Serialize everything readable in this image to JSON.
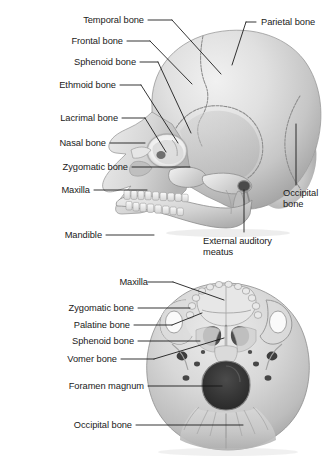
{
  "figure": {
    "background_color": "#ffffff",
    "text_color": "#1a1a1a",
    "leader_color": "#111111",
    "bone_light": "#e3e3e3",
    "bone_mid": "#c9c9c9",
    "bone_shadow": "#9a9a9a",
    "bone_dark": "#6e6e6e",
    "cavity_color": "#3a3a3a"
  },
  "panels": [
    {
      "id": "lateral-view",
      "name": "Lateral view of skull",
      "labels": [
        {
          "id": "temporal-bone",
          "text": "Temporal bone",
          "align": "right"
        },
        {
          "id": "frontal-bone",
          "text": "Frontal bone",
          "align": "right"
        },
        {
          "id": "sphenoid-bone",
          "text": "Sphenoid bone",
          "align": "right"
        },
        {
          "id": "ethmoid-bone",
          "text": "Ethmoid bone",
          "align": "right"
        },
        {
          "id": "lacrimal-bone",
          "text": "Lacrimal bone",
          "align": "right"
        },
        {
          "id": "nasal-bone",
          "text": "Nasal bone",
          "align": "right"
        },
        {
          "id": "zygomatic-bone",
          "text": "Zygomatic bone",
          "align": "right"
        },
        {
          "id": "maxilla",
          "text": "Maxilla",
          "align": "right"
        },
        {
          "id": "mandible",
          "text": "Mandible",
          "align": "right"
        },
        {
          "id": "parietal-bone",
          "text": "Parietal bone",
          "align": "left"
        },
        {
          "id": "occipital-bone-lateral",
          "text": "Occipital bone",
          "align": "left"
        },
        {
          "id": "external-auditory-meatus",
          "text": "External auditory meatus",
          "align": "left"
        }
      ]
    },
    {
      "id": "inferior-view",
      "name": "Inferior view of skull",
      "labels": [
        {
          "id": "maxilla-inferior",
          "text": "Maxilla",
          "align": "right"
        },
        {
          "id": "zygomatic-bone-inferior",
          "text": "Zygomatic bone",
          "align": "right"
        },
        {
          "id": "palatine-bone",
          "text": "Palatine bone",
          "align": "right"
        },
        {
          "id": "sphenoid-bone-inferior",
          "text": "Sphenoid bone",
          "align": "right"
        },
        {
          "id": "vomer-bone",
          "text": "Vomer bone",
          "align": "right"
        },
        {
          "id": "foramen-magnum",
          "text": "Foramen magnum",
          "align": "right"
        },
        {
          "id": "occipital-bone-inferior",
          "text": "Occipital bone",
          "align": "right"
        }
      ]
    }
  ]
}
